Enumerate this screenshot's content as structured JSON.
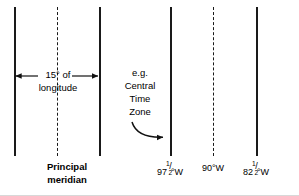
{
  "figure": {
    "type": "meridian-time-zone-diagram",
    "background_color": "#ffffff",
    "line_color": "#1a1a1a",
    "text_color": "#000000"
  },
  "labels": {
    "span_line1": "15° of",
    "span_line2": "longitude",
    "example_line1": "e.g.",
    "example_line2": "Central",
    "example_line3": "Time",
    "example_line4": "Zone",
    "principal_line1": "Principal",
    "principal_line2": "meridian"
  },
  "longitudes": [
    {
      "id": "lon-1",
      "whole": "97",
      "numerator": "1",
      "denominator": "2",
      "suffix": "°W",
      "text": "97½°W"
    },
    {
      "id": "lon-2",
      "whole": "90",
      "numerator": "",
      "denominator": "",
      "suffix": "°W",
      "text": "90°W"
    },
    {
      "id": "lon-3",
      "whole": "82",
      "numerator": "1",
      "denominator": "2",
      "suffix": "°W",
      "text": "82½°W"
    }
  ],
  "meridian_lines": [
    {
      "id": "meridian-1",
      "x": 14,
      "style": "solid"
    },
    {
      "id": "meridian-dashed-1",
      "x": 57,
      "style": "dashed"
    },
    {
      "id": "meridian-2",
      "x": 99,
      "style": "solid"
    },
    {
      "id": "meridian-3",
      "x": 170,
      "style": "solid"
    },
    {
      "id": "meridian-dashed-2",
      "x": 213,
      "style": "dashed"
    },
    {
      "id": "meridian-4",
      "x": 256,
      "style": "solid"
    }
  ],
  "annotations": {
    "span_arrow": "double-headed horizontal arrow between meridian-1 and meridian-2",
    "pointer_arrow": "curved arrow from Central Time Zone label to meridian-3"
  }
}
